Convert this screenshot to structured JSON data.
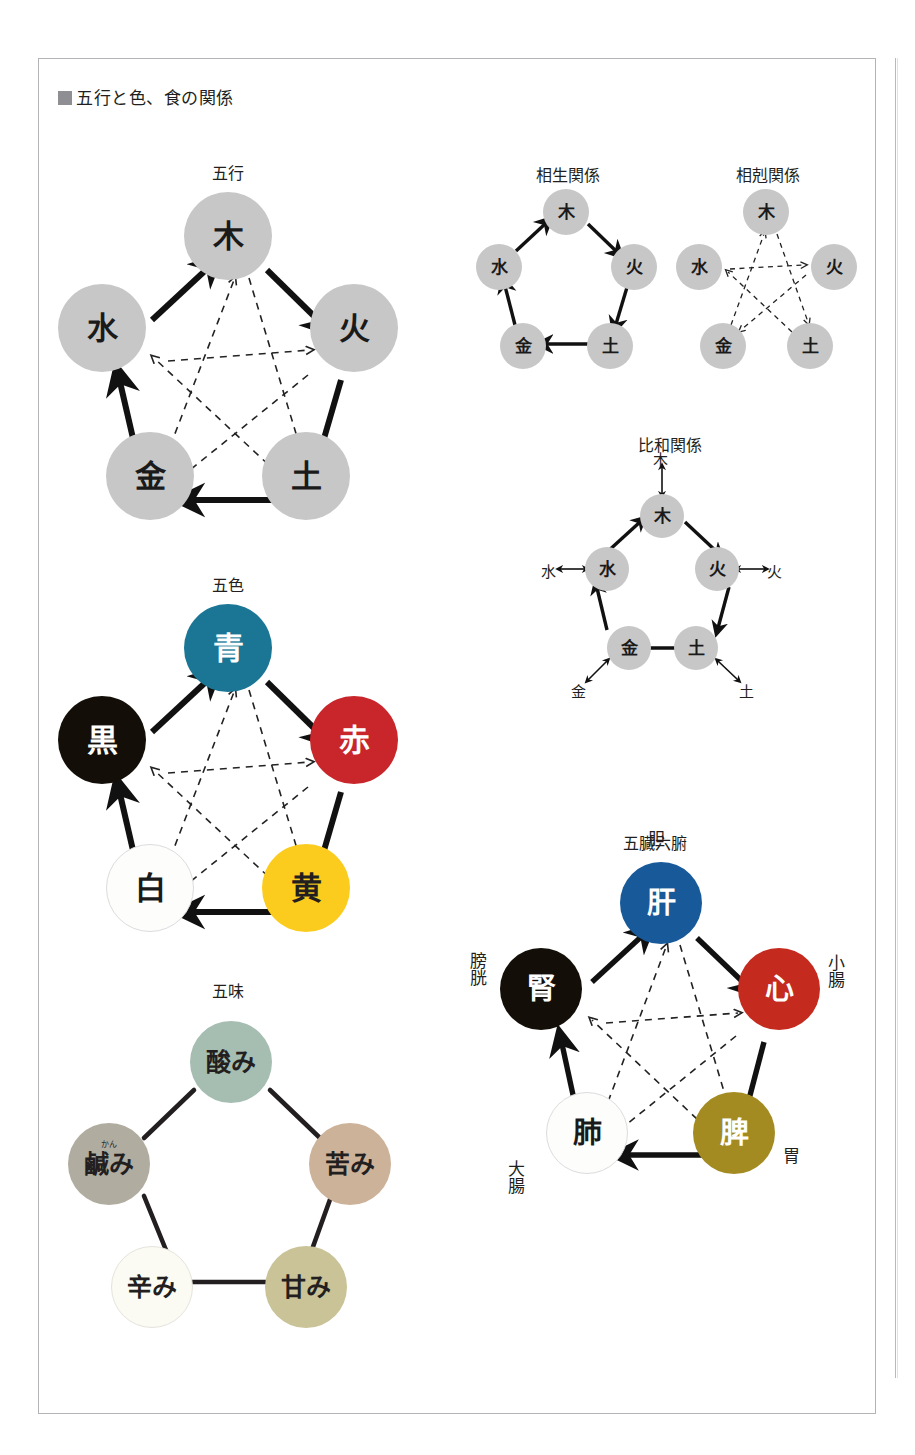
{
  "heading": {
    "marker": "■",
    "text": "五行と色、食の関係"
  },
  "colors": {
    "gray_node": "#c7c7c7",
    "blue": "#1a7694",
    "red": "#c8262b",
    "yellow": "#fbcc1e",
    "white": "#fdfdfc",
    "black": "#130f08",
    "organ_blue": "#18599a",
    "organ_red": "#c52a1e",
    "organ_olive": "#a38b22",
    "taste_sage": "#a6bdb2",
    "taste_tan": "#cdb29a",
    "taste_khaki": "#c9c397",
    "taste_ivory": "#fbfbf4",
    "taste_gray": "#b0aca0",
    "border": "#b4b4b8",
    "text": "#231f20"
  },
  "diagrams": {
    "gogyo": {
      "title": "五行",
      "nodes": [
        {
          "label": "木",
          "position": "top"
        },
        {
          "label": "火",
          "position": "right"
        },
        {
          "label": "土",
          "position": "bottom-right"
        },
        {
          "label": "金",
          "position": "bottom-left"
        },
        {
          "label": "水",
          "position": "left"
        }
      ],
      "solid_cycle": [
        "水",
        "木",
        "火",
        "土",
        "金",
        "水"
      ],
      "dashed_star": [
        "木",
        "土",
        "水",
        "火",
        "金",
        "木"
      ]
    },
    "sousei": {
      "title": "相生関係",
      "nodes": [
        {
          "label": "木",
          "position": "top"
        },
        {
          "label": "火",
          "position": "right"
        },
        {
          "label": "土",
          "position": "bottom-right"
        },
        {
          "label": "金",
          "position": "bottom-left"
        },
        {
          "label": "水",
          "position": "left"
        }
      ],
      "solid_cycle": [
        "水",
        "木",
        "火",
        "土",
        "金",
        "水"
      ]
    },
    "soukoku": {
      "title": "相剋関係",
      "nodes": [
        {
          "label": "木",
          "position": "top"
        },
        {
          "label": "火",
          "position": "right"
        },
        {
          "label": "土",
          "position": "bottom-right"
        },
        {
          "label": "金",
          "position": "bottom-left"
        },
        {
          "label": "水",
          "position": "left"
        }
      ],
      "dashed_star": [
        "木",
        "土",
        "水",
        "火",
        "金",
        "木"
      ]
    },
    "hiwa": {
      "title": "比和関係",
      "nodes": [
        {
          "label": "木",
          "position": "top",
          "pair": "木",
          "pair_side": "top"
        },
        {
          "label": "火",
          "position": "right",
          "pair": "火",
          "pair_side": "right"
        },
        {
          "label": "土",
          "position": "bottom-right",
          "pair": "土",
          "pair_side": "bottom-right"
        },
        {
          "label": "金",
          "position": "bottom-left",
          "pair": "金",
          "pair_side": "bottom-left"
        },
        {
          "label": "水",
          "position": "left",
          "pair": "水",
          "pair_side": "left"
        }
      ],
      "solid_cycle": [
        "水",
        "木",
        "火",
        "土",
        "金",
        "水"
      ]
    },
    "goshiki": {
      "title": "五色",
      "nodes": [
        {
          "label": "青",
          "position": "top",
          "color": "#1a7694"
        },
        {
          "label": "赤",
          "position": "right",
          "color": "#c8262b"
        },
        {
          "label": "黄",
          "position": "bottom-right",
          "color": "#fbcc1e"
        },
        {
          "label": "白",
          "position": "bottom-left",
          "color": "#fdfdfc"
        },
        {
          "label": "黒",
          "position": "left",
          "color": "#130f08"
        }
      ],
      "solid_cycle": [
        "黒",
        "青",
        "赤",
        "黄",
        "白",
        "黒"
      ],
      "dashed_star": [
        "青",
        "黄",
        "黒",
        "赤",
        "白",
        "青"
      ]
    },
    "gomi": {
      "title": "五味",
      "nodes": [
        {
          "label": "酸み",
          "position": "top",
          "color": "#a6bdb2"
        },
        {
          "label": "苦み",
          "position": "right",
          "color": "#cdb29a"
        },
        {
          "label": "甘み",
          "position": "bottom-right",
          "color": "#c9c397"
        },
        {
          "label": "辛み",
          "position": "bottom-left",
          "color": "#fbfbf4"
        },
        {
          "label": "鹹み",
          "ruby": "かん",
          "position": "left",
          "color": "#b0aca0"
        }
      ]
    },
    "gozo": {
      "title": "五臓六腑",
      "nodes": [
        {
          "label": "肝",
          "outer": "胆",
          "position": "top",
          "color": "#18599a"
        },
        {
          "label": "心",
          "outer": "小腸",
          "position": "right",
          "color": "#c52a1e"
        },
        {
          "label": "脾",
          "outer": "胃",
          "position": "bottom-right",
          "color": "#a38b22"
        },
        {
          "label": "肺",
          "outer": "大腸",
          "position": "bottom-left",
          "color": "#fdfdfc"
        },
        {
          "label": "腎",
          "outer": "膀胱",
          "position": "left",
          "color": "#130f08"
        }
      ],
      "solid_cycle": [
        "腎",
        "肝",
        "心",
        "脾",
        "肺",
        "腎"
      ],
      "dashed_star": [
        "肝",
        "脾",
        "腎",
        "心",
        "肺",
        "肝"
      ]
    }
  }
}
